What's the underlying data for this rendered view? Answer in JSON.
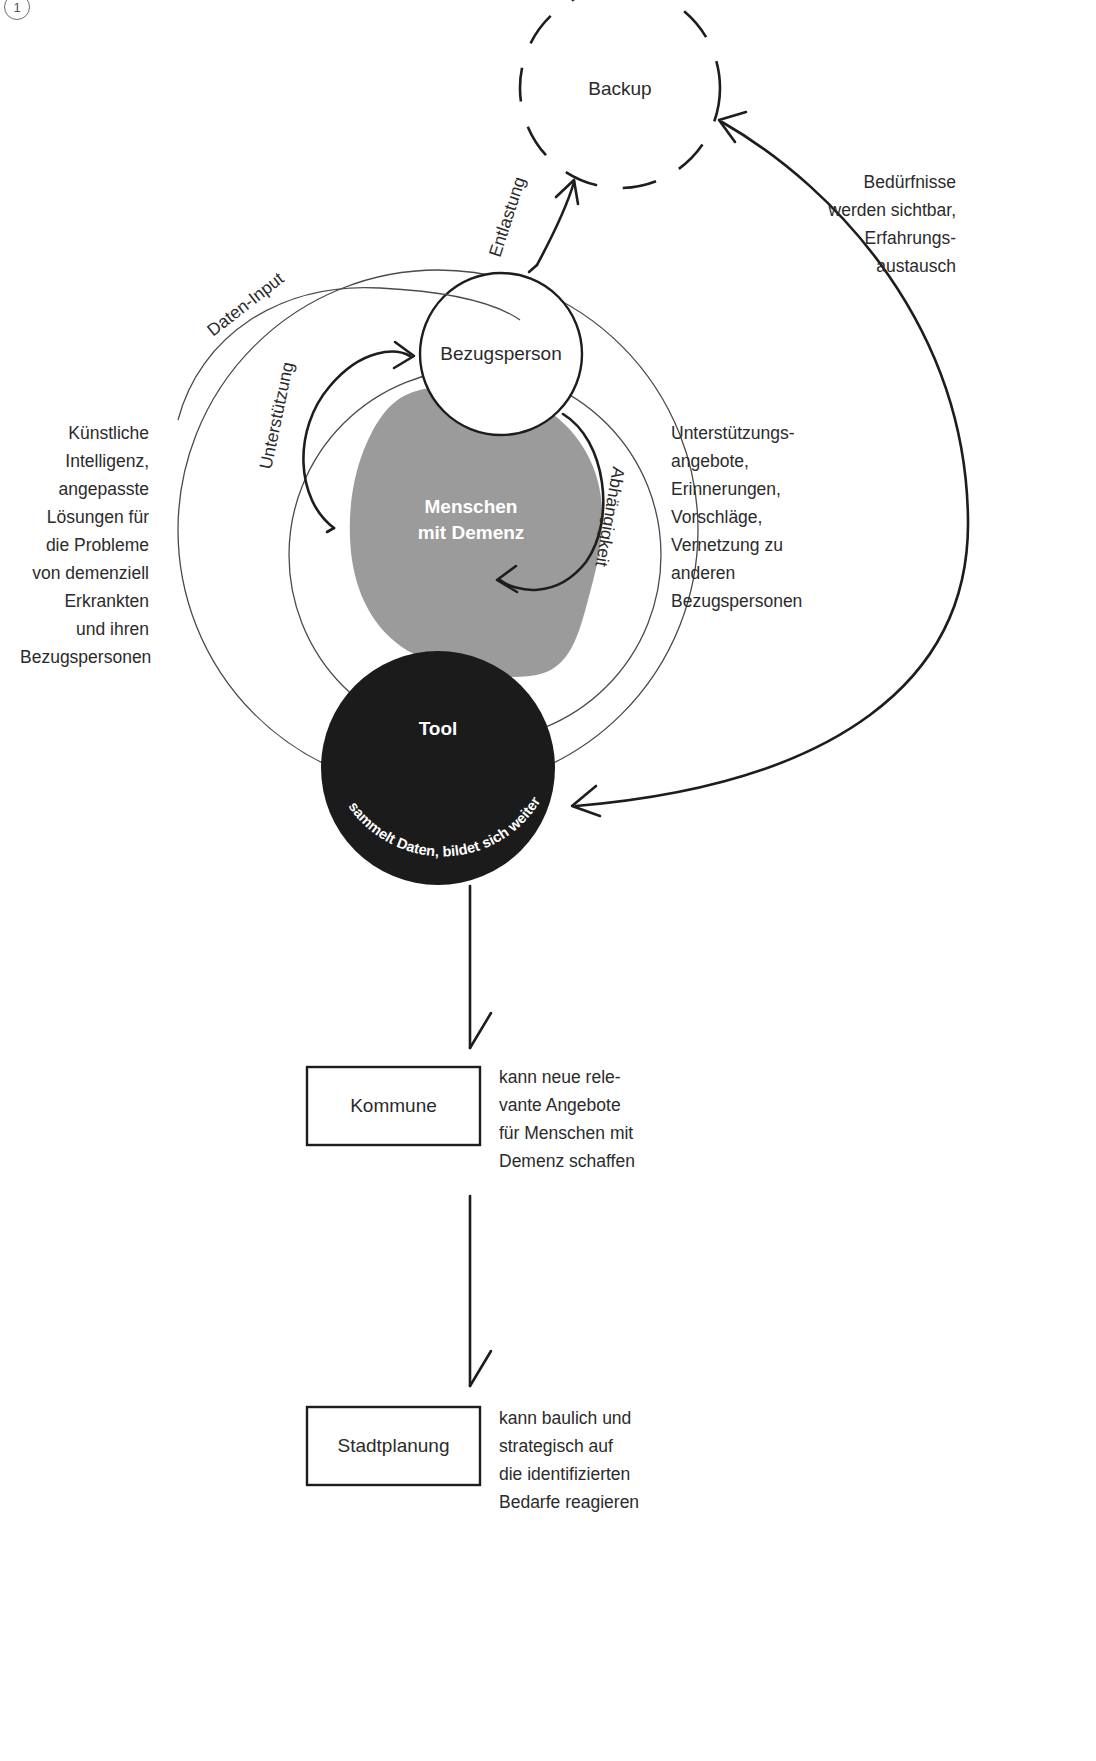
{
  "page_marker": "1",
  "diagram": {
    "nodes": {
      "backup": "Backup",
      "bezugsperson": "Bezugsperson",
      "menschen_mit_demenz_line1": "Menschen",
      "menschen_mit_demenz_line2": "mit Demenz",
      "tool": "Tool",
      "tool_caption": "sammelt Daten, bildet sich weiter",
      "kommune": "Kommune",
      "stadtplanung": "Stadtplanung"
    },
    "edge_labels": {
      "daten_input": "Daten-Input",
      "entlastung": "Entlastung",
      "unterstuetzung": "Unterstützung",
      "abhaengigkeit": "Abhängigkeit"
    },
    "annotations": {
      "left_block": "Künstliche\nIntelligenz,\nangepasste\nLösungen für\ndie Probleme\nvon demenziell\nErkrankten\nund ihren\nBezugspersonen",
      "right_top_block": "Bedürfnisse\nwerden sichtbar,\nErfahrungs-\naustausch",
      "right_mid_block": "Unterstützungs-\nangebote,\nErinnerungen,\nVorschläge,\nVernetzung zu\nanderen\nBezugspersonen",
      "kommune_note": "kann neue rele-\nvante Angebote\nfür Menschen mit\nDemenz schaffen",
      "stadtplanung_note": "kann baulich und\nstrategisch auf\ndie identifizierten\nBedarfe reagieren"
    },
    "colors": {
      "stroke": "#222222",
      "blob_gray": "#9b9b9b",
      "tool_black": "#1b1b1b",
      "text": "#2b2b2b",
      "thin_stroke": "#3a3a3a",
      "background": "#ffffff"
    }
  }
}
